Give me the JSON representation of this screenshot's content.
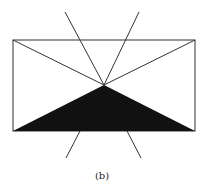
{
  "figure": {
    "caption": "(b)",
    "stroke_color": "#222222",
    "fill_color": "#111111"
  }
}
